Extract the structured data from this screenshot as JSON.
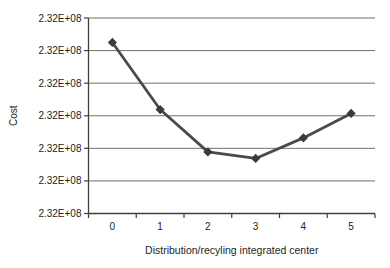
{
  "figure": {
    "title": "",
    "ylabel": "Cost",
    "xlabel": "Distribution/recyling integrated center"
  },
  "chart_data": {
    "type": "line",
    "title": "",
    "xlabel": "Distribution/recyling integrated center",
    "ylabel": "Cost",
    "categories": [
      "0",
      "1",
      "2",
      "3",
      "4",
      "5"
    ],
    "y_tick_labels": [
      "2.32E+08",
      "2.32E+08",
      "2.32E+08",
      "2.32E+08",
      "2.32E+08",
      "2.32E+08",
      "2.32E+08"
    ],
    "y_tick_note": "all seven y-axis tick labels display the rounded value 2.32E+08",
    "series": [
      {
        "name": "Cost",
        "x": [
          0,
          1,
          2,
          3,
          4,
          5
        ],
        "values_estimated": [
          232030000,
          231820000,
          231690000,
          231670000,
          231730000,
          231810000
        ],
        "axis_units_from_bottom": [
          5.25,
          3.19,
          1.89,
          1.69,
          2.32,
          3.07
        ]
      }
    ],
    "ylim_units": [
      0,
      6
    ],
    "grid": "horizontal",
    "legend": "none",
    "marker": "diamond",
    "colors": {
      "line": "#4a4a4a",
      "marker": "#3a3a3a",
      "gridline": "#707070",
      "axis": "#3f3f3f",
      "text": "#242424",
      "background": "#ffffff"
    }
  }
}
